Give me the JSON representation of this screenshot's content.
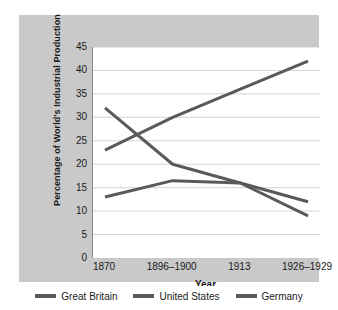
{
  "chart_data": {
    "type": "line",
    "title": "",
    "xlabel": "Year",
    "ylabel": "Percentage of World's Industrial Production",
    "categories": [
      "1870",
      "1896–1900",
      "1913",
      "1926–1929"
    ],
    "yticks": [
      "45",
      "40",
      "35",
      "30",
      "25",
      "20",
      "15",
      "10",
      "5",
      "0"
    ],
    "ylim": [
      0,
      45
    ],
    "grid": "horizontal",
    "legend_position": "bottom",
    "series": [
      {
        "name": "Great Britain",
        "color": "#5a5a5a",
        "values": [
          32,
          20,
          16,
          9
        ]
      },
      {
        "name": "United States",
        "color": "#5a5a5a",
        "values": [
          23,
          30,
          36,
          42
        ]
      },
      {
        "name": "Germany",
        "color": "#5a5a5a",
        "values": [
          13,
          16.5,
          16,
          12
        ]
      }
    ]
  },
  "legend": {
    "items": [
      {
        "label": "Great Britain"
      },
      {
        "label": "United States"
      },
      {
        "label": "Germany"
      }
    ]
  },
  "colors": {
    "card_background": "#c9c9c9",
    "plot_background": "#ffffff",
    "line": "#5a5a5a",
    "gridline": "#d4d4d4",
    "axis": "#8c8c8c",
    "text": "#1a1a1a"
  }
}
